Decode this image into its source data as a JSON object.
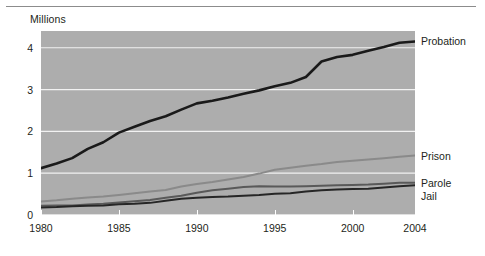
{
  "chart_data": {
    "type": "line",
    "title": "",
    "subtitle": "",
    "unit_caption": "Millions",
    "xlabel": "",
    "ylabel": "Millions",
    "xlim": [
      1980,
      2004
    ],
    "ylim": [
      0,
      4.4
    ],
    "grid": true,
    "gridlines": "horizontal white lines at 0, 1, 2, 3, 4",
    "legend_position": "right-end-of-line",
    "plot_background": "#adadad",
    "x": [
      1980,
      1981,
      1982,
      1983,
      1984,
      1985,
      1986,
      1987,
      1988,
      1989,
      1990,
      1991,
      1992,
      1993,
      1994,
      1995,
      1996,
      1997,
      1998,
      1999,
      2000,
      2001,
      2002,
      2003,
      2004
    ],
    "xticks": [
      1980,
      1985,
      1990,
      1995,
      2000,
      2004
    ],
    "xtick_labels": [
      "1980",
      "1985",
      "1990",
      "1995",
      "2000",
      "2004"
    ],
    "yticks": [
      0,
      1,
      2,
      3,
      4
    ],
    "ytick_labels": [
      "0",
      "1",
      "2",
      "3",
      "4"
    ],
    "series": [
      {
        "name": "Probation",
        "label": "Probation",
        "color": "#1a1a1a",
        "width": 2.6,
        "values": [
          1.12,
          1.23,
          1.36,
          1.58,
          1.74,
          1.97,
          2.11,
          2.25,
          2.36,
          2.52,
          2.67,
          2.73,
          2.81,
          2.9,
          2.98,
          3.08,
          3.16,
          3.3,
          3.67,
          3.78,
          3.83,
          3.93,
          4.02,
          4.12,
          4.15
        ]
      },
      {
        "name": "Prison",
        "label": "Prison",
        "color": "#8a8a8a",
        "width": 2.0,
        "values": [
          0.32,
          0.35,
          0.39,
          0.42,
          0.44,
          0.48,
          0.52,
          0.56,
          0.6,
          0.68,
          0.74,
          0.79,
          0.85,
          0.91,
          0.99,
          1.08,
          1.13,
          1.18,
          1.22,
          1.27,
          1.3,
          1.33,
          1.36,
          1.39,
          1.42
        ]
      },
      {
        "name": "Parole",
        "label": "Parole",
        "color": "#595959",
        "width": 2.0,
        "values": [
          0.22,
          0.23,
          0.23,
          0.25,
          0.27,
          0.3,
          0.33,
          0.36,
          0.41,
          0.46,
          0.53,
          0.59,
          0.63,
          0.67,
          0.69,
          0.68,
          0.68,
          0.69,
          0.7,
          0.71,
          0.72,
          0.73,
          0.75,
          0.77,
          0.77
        ]
      },
      {
        "name": "Jail",
        "label": "Jail",
        "color": "#262626",
        "width": 2.0,
        "values": [
          0.18,
          0.19,
          0.21,
          0.22,
          0.23,
          0.26,
          0.27,
          0.29,
          0.34,
          0.39,
          0.41,
          0.43,
          0.44,
          0.46,
          0.48,
          0.51,
          0.52,
          0.56,
          0.59,
          0.61,
          0.62,
          0.63,
          0.66,
          0.69,
          0.71
        ]
      }
    ]
  }
}
